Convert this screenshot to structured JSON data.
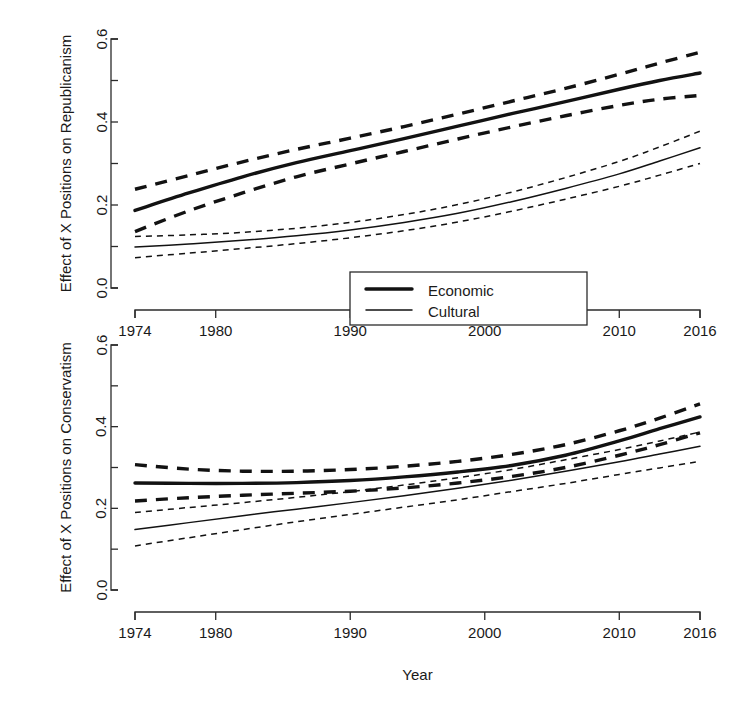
{
  "chart_data": [
    {
      "type": "line",
      "panel": "top",
      "title": "",
      "xlabel": "",
      "ylabel": "Effect of X Positions on Republicanism",
      "xlim": [
        1974,
        2016
      ],
      "ylim": [
        0.0,
        0.6
      ],
      "xticks": [
        1974,
        1980,
        1990,
        2000,
        2010,
        2016
      ],
      "xticklabels": [
        "1974",
        "1980",
        "1990",
        "2000",
        "2010",
        "2016"
      ],
      "yticks": [
        0.0,
        0.1,
        0.2,
        0.3,
        0.4,
        0.5,
        0.6
      ],
      "yticklabels": [
        "0.0",
        "",
        "0.2",
        "",
        "0.4",
        "",
        "0.6"
      ],
      "grid": false,
      "x": [
        1974,
        1978,
        1982,
        1986,
        1990,
        1994,
        1998,
        2002,
        2006,
        2010,
        2013,
        2016
      ],
      "series": [
        {
          "name": "Economic",
          "style": "solid-thick",
          "values": [
            0.187,
            0.229,
            0.268,
            0.302,
            0.331,
            0.36,
            0.39,
            0.42,
            0.449,
            0.479,
            0.5,
            0.518
          ]
        },
        {
          "name": "Economic upper CI",
          "style": "dashed-thick",
          "values": [
            0.238,
            0.271,
            0.304,
            0.334,
            0.361,
            0.389,
            0.419,
            0.45,
            0.481,
            0.515,
            0.542,
            0.568
          ]
        },
        {
          "name": "Economic lower CI",
          "style": "dashed-thick",
          "values": [
            0.136,
            0.186,
            0.229,
            0.268,
            0.299,
            0.329,
            0.359,
            0.388,
            0.415,
            0.44,
            0.455,
            0.464
          ]
        },
        {
          "name": "Cultural",
          "style": "solid-thin",
          "values": [
            0.099,
            0.106,
            0.115,
            0.126,
            0.14,
            0.158,
            0.18,
            0.208,
            0.24,
            0.275,
            0.306,
            0.338
          ]
        },
        {
          "name": "Cultural upper CI",
          "style": "dotted-thin",
          "values": [
            0.124,
            0.128,
            0.134,
            0.144,
            0.158,
            0.177,
            0.201,
            0.231,
            0.266,
            0.305,
            0.34,
            0.378
          ]
        },
        {
          "name": "Cultural lower CI",
          "style": "dotted-thin",
          "values": [
            0.073,
            0.084,
            0.095,
            0.107,
            0.121,
            0.138,
            0.159,
            0.185,
            0.214,
            0.245,
            0.272,
            0.3
          ]
        }
      ],
      "legend": {
        "position": "bottom-center",
        "entries": [
          {
            "label": "Economic",
            "style": "solid-thick"
          },
          {
            "label": "Cultural",
            "style": "solid-thin"
          }
        ]
      }
    },
    {
      "type": "line",
      "panel": "bottom",
      "title": "",
      "xlabel": "Year",
      "ylabel": "Effect of X Positions on Conservatism",
      "xlim": [
        1974,
        2016
      ],
      "ylim": [
        0.0,
        0.6
      ],
      "xticks": [
        1974,
        1980,
        1990,
        2000,
        2010,
        2016
      ],
      "xticklabels": [
        "1974",
        "1980",
        "1990",
        "2000",
        "2010",
        "2016"
      ],
      "yticks": [
        0.0,
        0.1,
        0.2,
        0.3,
        0.4,
        0.5,
        0.6
      ],
      "yticklabels": [
        "0.0",
        "",
        "0.2",
        "",
        "0.4",
        "",
        "0.6"
      ],
      "grid": false,
      "x": [
        1974,
        1978,
        1982,
        1986,
        1990,
        1994,
        1998,
        2002,
        2006,
        2010,
        2013,
        2016
      ],
      "series": [
        {
          "name": "Economic",
          "style": "solid-thick",
          "values": [
            0.262,
            0.261,
            0.261,
            0.263,
            0.268,
            0.277,
            0.289,
            0.305,
            0.33,
            0.365,
            0.395,
            0.424
          ]
        },
        {
          "name": "Economic upper CI",
          "style": "dashed-thick",
          "values": [
            0.307,
            0.296,
            0.291,
            0.291,
            0.295,
            0.303,
            0.315,
            0.332,
            0.356,
            0.39,
            0.421,
            0.456
          ]
        },
        {
          "name": "Economic lower CI",
          "style": "dashed-thick",
          "values": [
            0.218,
            0.226,
            0.232,
            0.237,
            0.242,
            0.25,
            0.262,
            0.278,
            0.3,
            0.33,
            0.356,
            0.385
          ]
        },
        {
          "name": "Cultural",
          "style": "solid-thin",
          "values": [
            0.148,
            0.165,
            0.182,
            0.198,
            0.214,
            0.231,
            0.249,
            0.269,
            0.291,
            0.314,
            0.333,
            0.352
          ]
        },
        {
          "name": "Cultural upper CI",
          "style": "dotted-thin",
          "values": [
            0.19,
            0.202,
            0.214,
            0.227,
            0.241,
            0.257,
            0.275,
            0.295,
            0.319,
            0.344,
            0.365,
            0.387
          ]
        },
        {
          "name": "Cultural lower CI",
          "style": "dotted-thin",
          "values": [
            0.108,
            0.128,
            0.148,
            0.167,
            0.185,
            0.203,
            0.221,
            0.241,
            0.261,
            0.283,
            0.299,
            0.315
          ]
        }
      ]
    }
  ],
  "axes": {
    "top": {
      "ylabel": "Effect of X Positions on Republicanism",
      "yticklabels": [
        "0.0",
        "0.2",
        "0.4",
        "0.6"
      ]
    },
    "bottom": {
      "ylabel": "Effect of X Positions on Conservatism",
      "yticklabels": [
        "0.0",
        "0.2",
        "0.4",
        "0.6"
      ],
      "xticklabels": [
        "1974",
        "1980",
        "1990",
        "2000",
        "2010",
        "2016"
      ],
      "xlabel": "Year"
    }
  },
  "legend": {
    "economic_label": "Economic",
    "cultural_label": "Cultural"
  },
  "colors": {
    "foreground": "#121212",
    "axis": "#2b2b2b",
    "background": "#ffffff"
  }
}
